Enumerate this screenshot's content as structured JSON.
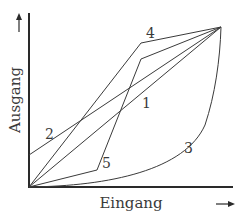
{
  "diagram": {
    "type": "transfer-curves",
    "x_axis": {
      "label": "Eingang",
      "arrow": "right-arrow"
    },
    "y_axis": {
      "label": "Ausgang",
      "arrow": "up-arrow"
    },
    "curves": [
      {
        "id": "1",
        "label": "1",
        "shape": "straight line from origin to top-right"
      },
      {
        "id": "2",
        "label": "2",
        "shape": "straight line with positive y-intercept to top-right"
      },
      {
        "id": "3",
        "label": "3",
        "shape": "convex curve hugging bottom, rising steeply to top-right"
      },
      {
        "id": "4",
        "label": "4",
        "shape": "piecewise: steep rise, then shallow to top-right"
      },
      {
        "id": "5",
        "label": "5",
        "shape": "piecewise: shallow, steep, then shallow to top-right"
      }
    ],
    "colors": {
      "line": "#3a3a3a",
      "background": "#ffffff"
    }
  }
}
